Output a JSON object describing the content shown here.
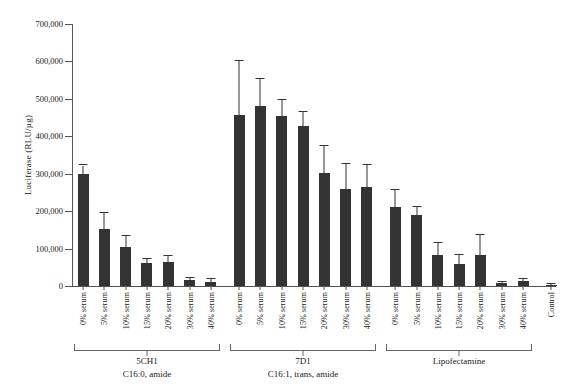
{
  "chart_data": {
    "type": "bar",
    "title": "",
    "xlabel": "",
    "ylabel": "Luciferase (RLU/µg)",
    "ylim": [
      0,
      700000
    ],
    "ytick_labels": [
      "700,000",
      "600,000",
      "500,000",
      "400,000",
      "300,000",
      "200,000",
      "100,000",
      "0"
    ],
    "ytick_values": [
      700000,
      600000,
      500000,
      400000,
      300000,
      200000,
      100000,
      0
    ],
    "grid": false,
    "legend": "none",
    "bar_color": "#333333",
    "error_bar_color": "#333333",
    "axis_color": "#555555",
    "categories": [
      "0% serum",
      "5% serum",
      "10% serum",
      "15% serum",
      "20% serum",
      "30% serum",
      "40% serum",
      "0% serum",
      "5% serum",
      "10% serum",
      "15% serum",
      "20% serum",
      "30% serum",
      "40% serum",
      "0% serum",
      "5% serum",
      "10% serum",
      "15% serum",
      "20% serum",
      "30% serum",
      "40% serum",
      "Control"
    ],
    "values": [
      300000,
      153000,
      105000,
      62000,
      65000,
      17000,
      12000,
      458000,
      480000,
      455000,
      428000,
      303000,
      258000,
      265000,
      212000,
      190000,
      83000,
      60000,
      82000,
      8000,
      13000,
      3000
    ],
    "errors_upper": [
      22000,
      42000,
      28000,
      10000,
      15000,
      5000,
      6000,
      142000,
      73000,
      42000,
      38000,
      72000,
      68000,
      58000,
      45000,
      22000,
      32000,
      22000,
      53000,
      4000,
      5000,
      2000
    ],
    "groups": [
      {
        "name": "5CH1",
        "sub": "C16:0, amide",
        "start": 0,
        "end": 6
      },
      {
        "name": "7D1",
        "sub": "C16:1, trans, amide",
        "start": 7,
        "end": 13
      },
      {
        "name": "Lipofectamine",
        "sub": "",
        "start": 14,
        "end": 20
      },
      {
        "name": "",
        "sub": "",
        "start": 21,
        "end": 21
      }
    ]
  }
}
